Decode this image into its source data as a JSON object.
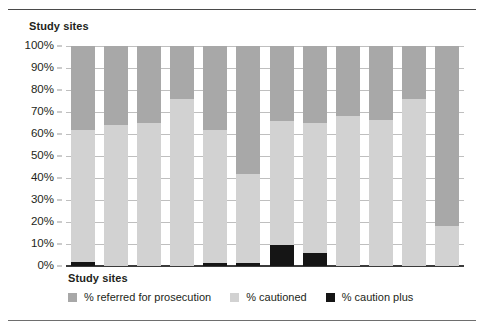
{
  "figure": {
    "top_axis_title": "Study sites",
    "bottom_axis_title": "Study sites"
  },
  "legend": {
    "items": [
      {
        "label": "% referred for prosecution",
        "color": "#a8a8a8",
        "swatch_name": "legend-swatch-prosecution"
      },
      {
        "label": "% cautioned",
        "color": "#d2d2d2",
        "swatch_name": "legend-swatch-cautioned"
      },
      {
        "label": "% caution plus",
        "color": "#151515",
        "swatch_name": "legend-swatch-caution-plus"
      }
    ]
  },
  "chart_data": {
    "type": "bar",
    "title": "",
    "subtitle": "",
    "xlabel": "Study sites",
    "ylabel": "",
    "ylim": [
      0,
      100
    ],
    "grid": true,
    "stacked": true,
    "stack_order_bottom_to_top": [
      "% caution plus",
      "% cautioned",
      "% referred for prosecution"
    ],
    "legend_position": "bottom",
    "tick_labels_y": [
      "0%",
      "10%",
      "20%",
      "30%",
      "40%",
      "50%",
      "60%",
      "70%",
      "80%",
      "90%",
      "100%"
    ],
    "tick_values_y": [
      0,
      10,
      20,
      30,
      40,
      50,
      60,
      70,
      80,
      90,
      100
    ],
    "categories": [
      "1",
      "2",
      "3",
      "4",
      "5",
      "6",
      "7",
      "8",
      "9",
      "10",
      "11",
      "12"
    ],
    "category_labels_shown": false,
    "series": [
      {
        "name": "% caution plus",
        "color": "#151515",
        "values": [
          2,
          0,
          0,
          0,
          1.5,
          1.5,
          9.5,
          6,
          0,
          0,
          0,
          0
        ]
      },
      {
        "name": "% cautioned",
        "color": "#d2d2d2",
        "values": [
          60,
          64,
          65,
          76,
          60.5,
          40.5,
          56.5,
          59,
          68,
          66.5,
          76,
          18
        ]
      },
      {
        "name": "% referred for prosecution",
        "color": "#a8a8a8",
        "values": [
          38,
          36,
          35,
          24,
          38,
          58,
          34,
          35,
          32,
          33.5,
          24,
          82
        ]
      }
    ]
  }
}
